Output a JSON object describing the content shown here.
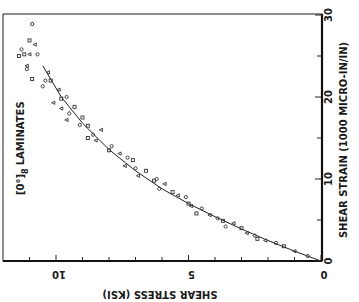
{
  "chart_data": {
    "type": "scatter",
    "orientation": "rotated-90",
    "title_main": "[0°]",
    "title_sub": "8",
    "title_rest": "LAMINATES",
    "xlabel": "SHEAR STRESS (KSI)",
    "ylabel": "SHEAR STRAIN (1000 MICRO-IN/IN)",
    "xlim": [
      0,
      12
    ],
    "ylim": [
      0,
      30
    ],
    "x_ticks": [
      0,
      5,
      10
    ],
    "x_minor_step": 1,
    "y_ticks": [
      0,
      10,
      20,
      30
    ],
    "y_minor_step": 5,
    "grid": false,
    "legend": null,
    "series": [
      {
        "name": "test data",
        "marker": "open-symbols",
        "points": [
          [
            10.9,
            28.9
          ],
          [
            11.0,
            26.9
          ],
          [
            10.8,
            26.4
          ],
          [
            11.3,
            25.8
          ],
          [
            11.2,
            25.2
          ],
          [
            11.0,
            25.2
          ],
          [
            10.7,
            25.2
          ],
          [
            11.4,
            25.0
          ],
          [
            11.1,
            23.8
          ],
          [
            11.1,
            23.4
          ],
          [
            10.9,
            22.2
          ],
          [
            10.3,
            23.0
          ],
          [
            10.4,
            22.0
          ],
          [
            10.2,
            22.0
          ],
          [
            9.9,
            20.9
          ],
          [
            10.5,
            21.3
          ],
          [
            9.8,
            19.8
          ],
          [
            10.1,
            19.3
          ],
          [
            9.6,
            20.0
          ],
          [
            9.3,
            18.8
          ],
          [
            9.8,
            18.6
          ],
          [
            9.5,
            18.0
          ],
          [
            9.0,
            17.5
          ],
          [
            9.6,
            17.2
          ],
          [
            9.1,
            16.6
          ],
          [
            8.8,
            16.5
          ],
          [
            8.3,
            16.0
          ],
          [
            8.6,
            15.4
          ],
          [
            8.8,
            15.0
          ],
          [
            8.5,
            14.7
          ],
          [
            7.9,
            14.0
          ],
          [
            8.0,
            13.5
          ],
          [
            7.6,
            13.1
          ],
          [
            7.3,
            12.6
          ],
          [
            7.1,
            12.3
          ],
          [
            7.4,
            11.6
          ],
          [
            7.0,
            11.3
          ],
          [
            6.6,
            11.0
          ],
          [
            6.9,
            10.4
          ],
          [
            6.2,
            10.0
          ],
          [
            6.3,
            9.8
          ],
          [
            5.9,
            9.4
          ],
          [
            6.1,
            8.8
          ],
          [
            5.6,
            8.4
          ],
          [
            5.4,
            8.0
          ],
          [
            5.1,
            7.8
          ],
          [
            5.0,
            7.0
          ],
          [
            4.9,
            6.7
          ],
          [
            4.5,
            6.4
          ],
          [
            4.7,
            5.8
          ],
          [
            4.2,
            5.6
          ],
          [
            3.9,
            5.2
          ],
          [
            3.7,
            4.9
          ],
          [
            3.3,
            4.6
          ],
          [
            3.6,
            4.2
          ],
          [
            3.0,
            4.0
          ],
          [
            2.8,
            3.4
          ],
          [
            2.5,
            3.1
          ],
          [
            2.4,
            2.7
          ],
          [
            2.1,
            2.5
          ],
          [
            1.7,
            2.2
          ],
          [
            1.4,
            1.8
          ],
          [
            1.0,
            1.2
          ],
          [
            0.5,
            0.6
          ]
        ]
      },
      {
        "name": "fitted curve",
        "type": "line",
        "points": [
          [
            0,
            0
          ],
          [
            1,
            1.2
          ],
          [
            2,
            2.5
          ],
          [
            3,
            3.9
          ],
          [
            4,
            5.4
          ],
          [
            5,
            7.0
          ],
          [
            6,
            8.8
          ],
          [
            7,
            11.0
          ],
          [
            8,
            13.6
          ],
          [
            9,
            16.8
          ],
          [
            9.8,
            20.0
          ],
          [
            10.5,
            23.8
          ]
        ]
      }
    ]
  }
}
